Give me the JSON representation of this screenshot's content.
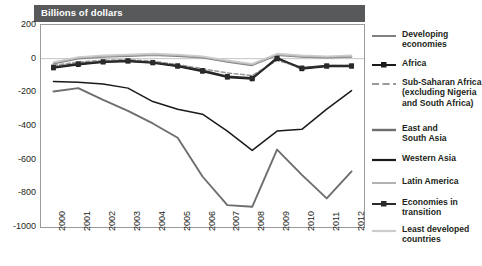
{
  "header": {
    "title": "Billions of dollars"
  },
  "axes": {
    "y_ticks": [
      "200",
      "0",
      "-200",
      "-400",
      "-600",
      "-800",
      "-1000"
    ],
    "x_ticks": [
      "2000",
      "2001",
      "2002",
      "2003",
      "2004",
      "2005",
      "2006",
      "2007",
      "2008",
      "2009",
      "2010",
      "2011",
      "2012"
    ]
  },
  "legend": {
    "items": [
      {
        "label": "Developing\neconomies",
        "style": "solid-gray"
      },
      {
        "label": "Africa",
        "style": "solid-black-square"
      },
      {
        "label": "Sub-Saharan Africa\n(excluding Nigeria\nand South Africa)",
        "style": "dashed-gray"
      },
      {
        "label": "East and\nSouth Asia",
        "style": "solid-darkgray-thick"
      },
      {
        "label": "Western Asia",
        "style": "solid-black"
      },
      {
        "label": "Latin America",
        "style": "solid-lightgray"
      },
      {
        "label": "Economies in\ntransition",
        "style": "solid-black-marker"
      },
      {
        "label": "Least developed\ncountries",
        "style": "solid-palegray"
      }
    ]
  },
  "chart_data": {
    "type": "line",
    "title": "Billions of dollars",
    "xlabel": "",
    "ylabel": "Billions of dollars",
    "ylim": [
      -1000,
      200
    ],
    "ytick_interval": 200,
    "grid": false,
    "legend_position": "right",
    "categories": [
      "2000",
      "2001",
      "2002",
      "2003",
      "2004",
      "2005",
      "2006",
      "2007",
      "2008",
      "2009",
      "2010",
      "2011",
      "2012"
    ],
    "series": [
      {
        "name": "Developing economies",
        "color": "#808080",
        "values": [
          -30,
          0,
          10,
          15,
          20,
          15,
          5,
          -20,
          -40,
          20,
          10,
          5,
          10
        ]
      },
      {
        "name": "Africa",
        "color": "#1a1a1a",
        "marker": "square",
        "values": [
          -55,
          -35,
          -20,
          -15,
          -25,
          -45,
          -75,
          -110,
          -120,
          5,
          -60,
          -45,
          -45
        ]
      },
      {
        "name": "Sub-Saharan Africa (excluding Nigeria and South Africa)",
        "color": "#9a9a9a",
        "dash": true,
        "values": [
          -40,
          -20,
          -10,
          -5,
          -15,
          -35,
          -60,
          -85,
          -100,
          -10,
          -55,
          -40,
          -40
        ]
      },
      {
        "name": "East and South Asia",
        "color": "#6e6e6e",
        "values": [
          -195,
          -175,
          -245,
          -310,
          -385,
          -470,
          -700,
          -870,
          -880,
          -540,
          -690,
          -830,
          -670
        ]
      },
      {
        "name": "Western Asia",
        "color": "#1a1a1a",
        "values": [
          -135,
          -140,
          -150,
          -175,
          -255,
          -300,
          -330,
          -430,
          -545,
          -430,
          -420,
          -300,
          -190
        ]
      },
      {
        "name": "Latin America",
        "color": "#b3b3b3",
        "values": [
          -25,
          5,
          15,
          20,
          25,
          20,
          10,
          -15,
          -35,
          25,
          15,
          10,
          15
        ]
      },
      {
        "name": "Economies in transition",
        "color": "#2b2b2b",
        "marker": "square",
        "values": [
          -50,
          -30,
          -18,
          -12,
          -22,
          -42,
          -70,
          -105,
          -115,
          0,
          -55,
          -42,
          -42
        ]
      },
      {
        "name": "Least developed countries",
        "color": "#cccccc",
        "values": [
          -20,
          10,
          20,
          25,
          30,
          25,
          15,
          -10,
          -30,
          30,
          20,
          15,
          20
        ]
      }
    ]
  }
}
